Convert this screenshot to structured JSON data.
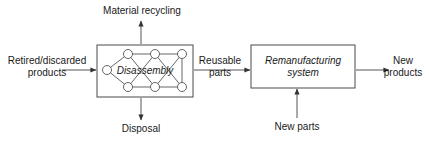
{
  "diagram": {
    "type": "process-flow-block-diagram",
    "background_color": "#ffffff",
    "stroke_color": "#444444",
    "text_color": "#1a1a1a",
    "boxes": [
      {
        "id": "disassembly",
        "label": "Disassembly",
        "italic": true,
        "x": 97,
        "y": 45,
        "width": 96,
        "height": 52,
        "contains": "node-network-graph"
      },
      {
        "id": "remanufacturing",
        "label": "Remanufacturing\nsystem",
        "italic": true,
        "x": 251,
        "y": 45,
        "width": 104,
        "height": 43,
        "contains": "none"
      }
    ],
    "labels": [
      {
        "id": "material-recycling",
        "text": "Material recycling",
        "x": 99,
        "y": 5
      },
      {
        "id": "retired-discarded-products",
        "text": "Retired/discarded\nproducts",
        "x": 6,
        "y": 54
      },
      {
        "id": "reusable-parts",
        "text": "Reusable\nparts",
        "x": 198,
        "y": 54
      },
      {
        "id": "new-products",
        "text": "New\nproducts",
        "x": 379,
        "y": 54
      },
      {
        "id": "disposal",
        "text": "Disposal",
        "x": 119,
        "y": 124
      },
      {
        "id": "new-parts",
        "text": "New parts",
        "x": 271,
        "y": 122
      }
    ],
    "arrows": [
      {
        "id": "arrow-retired-to-disassembly",
        "from": "retired-discarded-products",
        "to": "disassembly",
        "direction": "right"
      },
      {
        "id": "arrow-disassembly-to-material-recycling",
        "from": "disassembly",
        "to": "material-recycling",
        "direction": "up"
      },
      {
        "id": "arrow-disassembly-to-disposal",
        "from": "disassembly",
        "to": "disposal",
        "direction": "down"
      },
      {
        "id": "arrow-disassembly-to-remanufacturing",
        "from": "disassembly",
        "to": "remanufacturing",
        "direction": "right",
        "label": "Reusable parts"
      },
      {
        "id": "arrow-new-parts-to-remanufacturing",
        "from": "new-parts",
        "to": "remanufacturing",
        "direction": "up"
      },
      {
        "id": "arrow-remanufacturing-to-new-products",
        "from": "remanufacturing",
        "to": "new-products",
        "direction": "right"
      }
    ],
    "network": {
      "node_radius": 4.5,
      "nodes": [
        {
          "id": "n-left",
          "cx": 107,
          "cy": 70
        },
        {
          "id": "n-top-1",
          "cx": 128,
          "cy": 54
        },
        {
          "id": "n-top-2",
          "cx": 155,
          "cy": 54
        },
        {
          "id": "n-top-3",
          "cx": 182,
          "cy": 54
        },
        {
          "id": "n-bot-1",
          "cx": 128,
          "cy": 87
        },
        {
          "id": "n-bot-2",
          "cx": 155,
          "cy": 87
        },
        {
          "id": "n-bot-3",
          "cx": 182,
          "cy": 87
        }
      ],
      "edges": [
        [
          "n-left",
          "n-top-1"
        ],
        [
          "n-left",
          "n-bot-1"
        ],
        [
          "n-top-1",
          "n-top-2"
        ],
        [
          "n-top-2",
          "n-top-3"
        ],
        [
          "n-bot-1",
          "n-bot-2"
        ],
        [
          "n-bot-2",
          "n-bot-3"
        ],
        [
          "n-top-1",
          "n-bot-2"
        ],
        [
          "n-bot-1",
          "n-top-2"
        ],
        [
          "n-top-2",
          "n-bot-3"
        ],
        [
          "n-bot-2",
          "n-top-3"
        ],
        [
          "n-top-3",
          "n-bot-3"
        ]
      ]
    }
  }
}
